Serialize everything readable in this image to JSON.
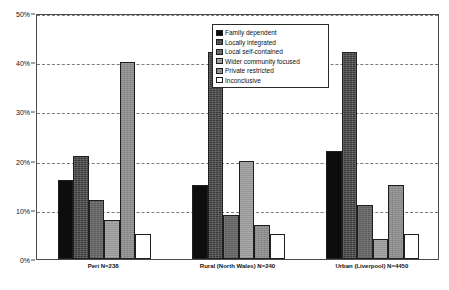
{
  "chart_data": {
    "type": "bar",
    "title": "",
    "subtitle": "",
    "xlabel": "",
    "ylabel": "",
    "ylim": [
      0,
      50
    ],
    "ytick_labels": [
      "0%",
      "10%",
      "20%",
      "30%",
      "40%",
      "50%"
    ],
    "ytick_values": [
      0,
      10,
      20,
      30,
      40,
      50
    ],
    "grid": true,
    "grid_axis": "y",
    "grid_style": "dashed",
    "legend_position": "top-center",
    "categories": [
      "Peri N=238",
      "Rural (North Wales) N=240",
      "Urban (Liverpool) N=4450"
    ],
    "series": [
      {
        "name": "Family dependent",
        "color": "#0d0d0d",
        "values": [
          16,
          15,
          22
        ]
      },
      {
        "name": "Locally integrated",
        "color": "#3a3a3a",
        "values": [
          21,
          42,
          42
        ]
      },
      {
        "name": "Local self-contained",
        "color": "#6e6e6e",
        "values": [
          12,
          9,
          11
        ]
      },
      {
        "name": "Wider community focused",
        "color": "#a8a8a8",
        "values": [
          8,
          20,
          4
        ]
      },
      {
        "name": "Private restricted",
        "color": "#8c8c8c",
        "values": [
          40,
          7,
          15
        ]
      },
      {
        "name": "Inconclusive",
        "color": "#ffffff",
        "values": [
          5,
          5,
          5
        ]
      }
    ]
  }
}
